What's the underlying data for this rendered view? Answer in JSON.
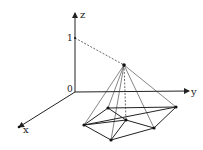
{
  "diagram": {
    "type": "3d-pyramid-over-hexagon",
    "axes": {
      "z_label": "z",
      "y_label": "y",
      "x_label": "x",
      "origin_label": "0",
      "z_tick_label": "1"
    },
    "apex": {
      "x": 124,
      "y": 65
    },
    "origin": {
      "x": 75,
      "y": 92
    },
    "base_points": [
      {
        "id": "A",
        "x": 108,
        "y": 108
      },
      {
        "id": "B",
        "x": 176,
        "y": 107
      },
      {
        "id": "C",
        "x": 126,
        "y": 120
      },
      {
        "id": "D",
        "x": 84,
        "y": 125
      },
      {
        "id": "E",
        "x": 154,
        "y": 128
      },
      {
        "id": "F",
        "x": 111,
        "y": 140
      }
    ],
    "colors": {
      "stroke": "#222222",
      "background": "#ffffff"
    }
  }
}
